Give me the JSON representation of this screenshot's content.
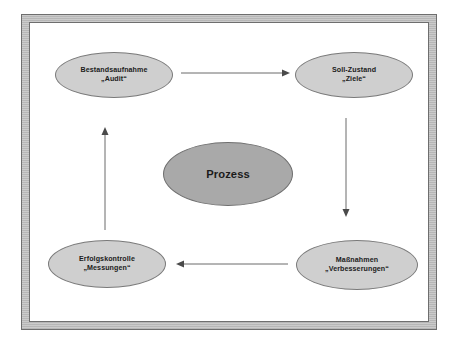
{
  "diagram": {
    "title_text": "Prozess",
    "frame": {
      "band_color": "#bcbcbc",
      "line_color": "#6e6e6e",
      "inner_background": "#ffffff"
    },
    "node_colors": {
      "light_fill": "#cfcfcf",
      "dark_fill": "#a9a9a9",
      "stroke": "#7a7a7a",
      "text": "#1b1b1b"
    },
    "arrow_color": "#6b6b6b",
    "nodes": {
      "audit": {
        "line1": "Bestandsaufnahme",
        "line2": "„Audit“"
      },
      "ziele": {
        "line1": "Soll-Zustand",
        "line2": "„Ziele“"
      },
      "prozess": {
        "line1": "Prozess"
      },
      "messungen": {
        "line1": "Erfolgskontrolle",
        "line2": "„Messungen“"
      },
      "verbesserungen": {
        "line1": "Maßnahmen",
        "line2": "„Verbesserungen“"
      }
    },
    "arrows": {
      "top": "audit-to-ziele",
      "right": "ziele-to-verbesserungen",
      "bottom": "verbesserungen-to-messungen",
      "left": "messungen-to-audit"
    }
  }
}
